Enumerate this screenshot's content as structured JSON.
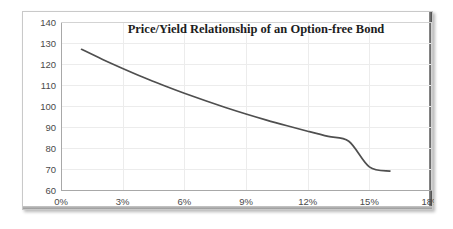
{
  "figure": {
    "background_color": "#ffffff",
    "frame_border_color": "#c9c9c9"
  },
  "chart_data": {
    "type": "line",
    "title": "Price/Yield Relationship of an Option-free Bond",
    "xlabel": "",
    "ylabel": "",
    "xlim": [
      0,
      18
    ],
    "ylim": [
      60,
      140
    ],
    "grid": true,
    "legend": "none",
    "line_color": "#4f4f4f",
    "x_tick_labels": [
      "0%",
      "3%",
      "6%",
      "9%",
      "12%",
      "15%",
      "18%"
    ],
    "x_tick_values": [
      0,
      3,
      6,
      9,
      12,
      15,
      18
    ],
    "y_tick_labels": [
      "60",
      "70",
      "80",
      "90",
      "100",
      "110",
      "120",
      "130",
      "140"
    ],
    "y_tick_values": [
      60,
      70,
      80,
      90,
      100,
      110,
      120,
      130,
      140
    ],
    "series": [
      {
        "name": "Option-free bond price",
        "x": [
          1.0,
          2.0,
          3.0,
          4.0,
          5.0,
          6.0,
          7.0,
          8.0,
          9.0,
          10.0,
          11.0,
          12.0,
          13.0,
          14.0,
          15.0,
          16.0
        ],
        "values": [
          127.0,
          122.3,
          117.9,
          113.7,
          109.8,
          106.1,
          102.6,
          99.3,
          96.2,
          93.3,
          90.6,
          88.0,
          85.5,
          83.2,
          71.0,
          69.0
        ]
      }
    ],
    "annotations": []
  }
}
